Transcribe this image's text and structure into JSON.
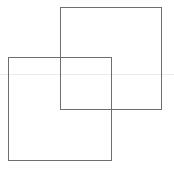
{
  "diagram": {
    "background": "#ffffff",
    "guide_line": {
      "y": 74,
      "color": "#ebebeb"
    },
    "squares": [
      {
        "name": "square-back",
        "x": 60,
        "y": 7,
        "w": 102,
        "h": 103,
        "stroke": "#6e6e6e"
      },
      {
        "name": "square-front",
        "x": 8,
        "y": 57,
        "w": 104,
        "h": 104,
        "stroke": "#6e6e6e"
      }
    ],
    "caption": ""
  }
}
